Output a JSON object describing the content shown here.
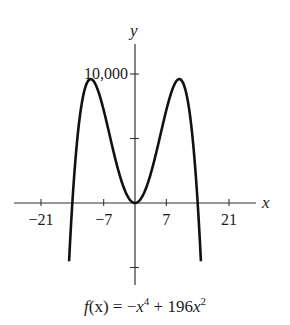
{
  "chart_data": {
    "type": "line",
    "title": "",
    "function": "f(x) = -x^4 + 196x^2",
    "caption": {
      "fx": "f",
      "paren_x": "(x)",
      "equals": " = −",
      "x1": "x",
      "exp1": "4",
      "plus": " + 196",
      "x2": "x",
      "exp2": "2"
    },
    "xlabel": "x",
    "ylabel": "y",
    "x_ticks": [
      -21,
      -7,
      7,
      21
    ],
    "x_tick_labels": [
      "−21",
      "−7",
      "7",
      "21"
    ],
    "y_ticks": [
      -5000,
      5000,
      10000
    ],
    "y_tick_labels": [
      "",
      "",
      "10,000"
    ],
    "xlim": [
      -27,
      27
    ],
    "ylim": [
      -6400,
      12400
    ],
    "curve_domain": [
      -15.5,
      15.5
    ],
    "key_points": {
      "zeros": [
        -14,
        0,
        14
      ],
      "local_max": [
        [
          -9.9,
          9604
        ],
        [
          9.9,
          9604
        ]
      ],
      "local_min": [
        [
          0,
          0
        ]
      ]
    },
    "series": [
      {
        "name": "f(x)",
        "x": [
          -15.5,
          -15,
          -14,
          -13,
          -12,
          -11,
          -10,
          -9.9,
          -9,
          -8,
          -7,
          -6,
          -5,
          -4,
          -3,
          -2,
          -1,
          0,
          1,
          2,
          3,
          4,
          5,
          6,
          7,
          8,
          9,
          9.9,
          10,
          11,
          12,
          13,
          14,
          15,
          15.5
        ],
        "values": [
          -10670,
          -6525,
          0,
          4563,
          8640,
          9075,
          9600,
          9604,
          9315,
          8448,
          7203,
          5760,
          4275,
          2880,
          1683,
          768,
          195,
          0,
          195,
          768,
          1683,
          2880,
          4275,
          5760,
          7203,
          8448,
          9315,
          9604,
          9600,
          9075,
          8640,
          4563,
          0,
          -6525,
          -10670
        ]
      }
    ],
    "grid": false,
    "legend": "none"
  }
}
